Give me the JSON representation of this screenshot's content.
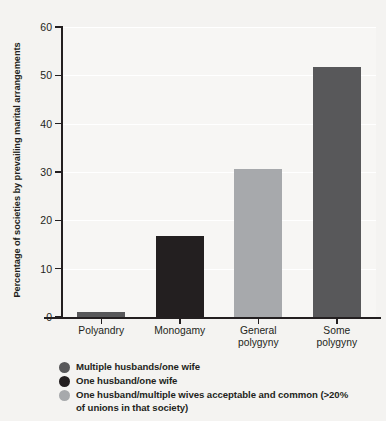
{
  "chart_data": {
    "type": "bar",
    "title": "",
    "xlabel": "",
    "ylabel": "Percentage of societies by prevailing marital arrangements",
    "categories": [
      "Polyandry",
      "Monogamy",
      "General polygyny",
      "Some polygyny"
    ],
    "category_lines": [
      [
        "Polyandry"
      ],
      [
        "Monogamy"
      ],
      [
        "General",
        "polygyny"
      ],
      [
        "Some",
        "polygyny"
      ]
    ],
    "values": [
      1.1,
      16.8,
      30.6,
      51.8
    ],
    "bar_colors": [
      "#58585a",
      "#231f20",
      "#a7a9ac",
      "#58585a"
    ],
    "ylim": [
      0,
      60
    ],
    "yticks": [
      0,
      10,
      20,
      30,
      40,
      50,
      60
    ],
    "ytick_labels": [
      "0",
      "10",
      "20",
      "30",
      "40",
      "50",
      "60"
    ],
    "grid": true,
    "grid_color": "#ffffff",
    "legend_position": "below",
    "legend": [
      {
        "color": "#58585a",
        "label": "Multiple husbands/one wife"
      },
      {
        "color": "#231f20",
        "label": "One husband/one wife"
      },
      {
        "color": "#a7a9ac",
        "label": "One husband/multiple wives acceptable and common (>20% of unions in that society)"
      }
    ]
  },
  "legend_lines": [
    [
      "Multiple husbands/one wife"
    ],
    [
      "One husband/one wife"
    ],
    [
      "One husband/multiple wives acceptable and common (>20%",
      "of unions in that society)"
    ]
  ]
}
